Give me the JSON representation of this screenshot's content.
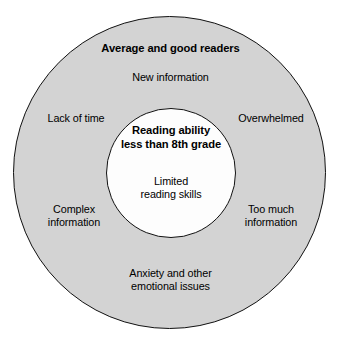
{
  "diagram": {
    "type": "concentric-venn",
    "background_color": "#ffffff",
    "outer_circle": {
      "fill_color": "#d3d3d3",
      "stroke_color": "#111111",
      "heading": "Average and good readers",
      "labels": {
        "top": "New information",
        "upper_left": "Lack of time",
        "upper_right": "Overwhelmed",
        "lower_left_line1": "Complex",
        "lower_left_line2": "information",
        "lower_right_line1": "Too much",
        "lower_right_line2": "information",
        "bottom_line1": "Anxiety and other",
        "bottom_line2": "emotional issues"
      }
    },
    "inner_circle": {
      "fill_color": "#fdfdfd",
      "stroke_color": "#111111",
      "heading_line1": "Reading ability",
      "heading_line2": "less than 8th grade",
      "label_line1": "Limited",
      "label_line2": "reading skills"
    }
  }
}
